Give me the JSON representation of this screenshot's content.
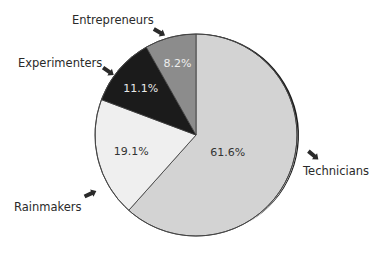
{
  "chart_data": {
    "type": "pie",
    "title": "",
    "start": "12 o'clock",
    "direction": "clockwise",
    "slices": [
      {
        "label": "Technicians",
        "value": 61.6,
        "value_label": "61.6%",
        "color": "#d3d3d3",
        "text_color": "#333333"
      },
      {
        "label": "Rainmakers",
        "value": 19.1,
        "value_label": "19.1%",
        "color": "#efefef",
        "text_color": "#333333"
      },
      {
        "label": "Experimenters",
        "value": 11.1,
        "value_label": "11.1%",
        "color": "#1b1b1b",
        "text_color": "#e8e8e8"
      },
      {
        "label": "Entrepreneurs",
        "value": 8.2,
        "value_label": "8.2%",
        "color": "#8c8c8c",
        "text_color": "#eeeeee"
      }
    ],
    "legend": "callout labels with arrows"
  }
}
